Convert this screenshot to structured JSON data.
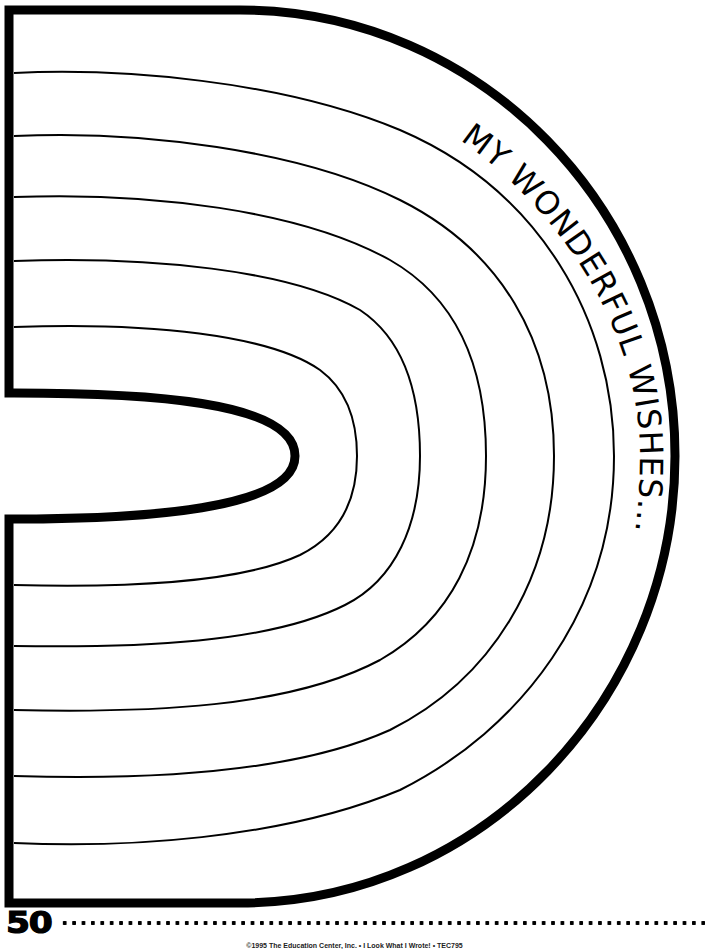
{
  "page": {
    "title": "MY WONDERFUL WISHES...",
    "page_number": "50",
    "copyright": "©1995 The Education Center, Inc. • I Look What I Wrote! • TEC795"
  },
  "worksheet": {
    "shape": "half-rainbow / D-shaped writing frame",
    "writing_lines_count": 5,
    "line_color": "#000000",
    "border_color": "#000000",
    "background_color": "#ffffff"
  }
}
